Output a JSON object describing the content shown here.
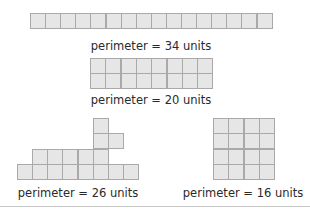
{
  "figures": [
    {
      "name": "strip-1x16",
      "label": "perimeter = 34 units",
      "label_pos": [
        151,
        39
      ],
      "cells": {
        "origin": [
          30,
          13
        ],
        "size": 15.1,
        "rows": 1,
        "cols": 16
      }
    },
    {
      "name": "rect-2x8",
      "label": "perimeter = 20 units",
      "label_pos": [
        151,
        93
      ],
      "cells": {
        "origin": [
          90,
          58
        ],
        "size": 15.3,
        "rows": 2,
        "cols": 8
      }
    },
    {
      "name": "irregular-shape",
      "label": "perimeter = 26 units",
      "label_pos": [
        78,
        186
      ],
      "squares": [
        [
          17,
          164
        ],
        [
          32,
          164
        ],
        [
          47,
          164
        ],
        [
          62,
          164
        ],
        [
          78,
          164
        ],
        [
          93,
          164
        ],
        [
          108,
          164
        ],
        [
          123,
          164
        ],
        [
          32,
          149
        ],
        [
          47,
          149
        ],
        [
          62,
          149
        ],
        [
          78,
          149
        ],
        [
          93,
          149
        ],
        [
          93,
          133
        ],
        [
          108,
          133
        ],
        [
          93,
          118
        ]
      ],
      "size": 15.3
    },
    {
      "name": "square-4x4",
      "label": "perimeter = 16 units",
      "label_pos": [
        243,
        186
      ],
      "cells": {
        "origin": [
          213,
          118
        ],
        "size": 15.4,
        "rows": 4,
        "cols": 4
      }
    }
  ],
  "colors": {
    "fill": "#e6e6e6",
    "stroke": "#a9a9a9",
    "text": "#2a2a2a"
  }
}
